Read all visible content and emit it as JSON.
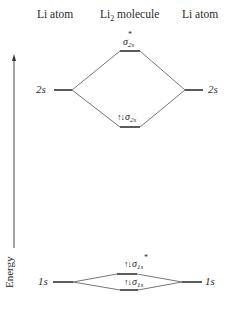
{
  "headers": {
    "left": "Li atom",
    "center_prefix": "Li",
    "center_sub": "2",
    "center_suffix": " molecule",
    "right": "Li atom"
  },
  "axis": {
    "label": "Energy",
    "direction": "up"
  },
  "atomic_orbitals": {
    "left_2s": "2s",
    "right_2s": "2s",
    "left_1s": "1s",
    "right_1s": "1s"
  },
  "molecular_orbitals": [
    {
      "name": "σ",
      "sub": "2s",
      "star": "*",
      "electrons": "",
      "type": "antibonding"
    },
    {
      "name": "σ",
      "sub": "2s",
      "star": "",
      "electrons": "↑↓",
      "type": "bonding"
    },
    {
      "name": "σ",
      "sub": "1s",
      "star": "*",
      "electrons": "↑↓",
      "type": "antibonding"
    },
    {
      "name": "σ",
      "sub": "1s",
      "star": "",
      "electrons": "↑↓",
      "type": "bonding"
    }
  ],
  "colors": {
    "line": "#555555",
    "level": "#333333",
    "text": "#2a2a2a"
  }
}
